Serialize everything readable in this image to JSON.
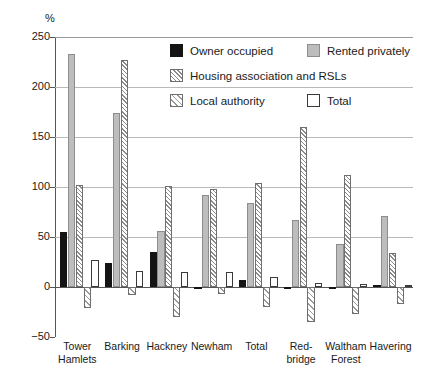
{
  "chart_data": {
    "type": "bar",
    "title": "",
    "xlabel": "",
    "ylabel": "%",
    "ylim": [
      -50,
      250
    ],
    "yticks": [
      -50,
      0,
      50,
      100,
      150,
      200,
      250
    ],
    "ytick_labels": [
      "−50",
      "0",
      "50",
      "100",
      "150",
      "200",
      "250"
    ],
    "grid": true,
    "legend_position": "inside-top-center",
    "categories": [
      "Tower\nHamlets",
      "Barking",
      "Hackney",
      "Newham",
      "Total",
      "Red-\nbridge",
      "Waltham\nForest",
      "Havering"
    ],
    "series": [
      {
        "name": "Owner occupied",
        "style": "solid-black",
        "color": "#141414",
        "values": [
          55,
          24,
          35,
          -1,
          7,
          -1,
          -2,
          2
        ]
      },
      {
        "name": "Rented privately",
        "style": "solid-grey",
        "color": "#bdbdbd",
        "values": [
          233,
          174,
          56,
          92,
          84,
          67,
          43,
          71
        ]
      },
      {
        "name": "Housing association and RSLs",
        "style": "hatch-dense",
        "color": "#8a8a8a",
        "values": [
          102,
          227,
          101,
          98,
          104,
          160,
          112,
          34
        ]
      },
      {
        "name": "Local authority",
        "style": "hatch-sparse",
        "color": "#9a9a9a",
        "values": [
          -21,
          -8,
          -30,
          -7,
          -20,
          -35,
          -27,
          -17
        ]
      },
      {
        "name": "Total",
        "style": "outline",
        "color": "#ffffff",
        "values": [
          27,
          16,
          15,
          15,
          10,
          4,
          3,
          2
        ]
      }
    ]
  },
  "legend": {
    "items": [
      {
        "label": "Owner occupied",
        "key": "owner"
      },
      {
        "label": "Rented privately",
        "key": "rented"
      },
      {
        "label": "Housing association and RSLs",
        "key": "ha"
      },
      {
        "label": "Local authority",
        "key": "la"
      },
      {
        "label": "Total",
        "key": "total"
      }
    ]
  }
}
